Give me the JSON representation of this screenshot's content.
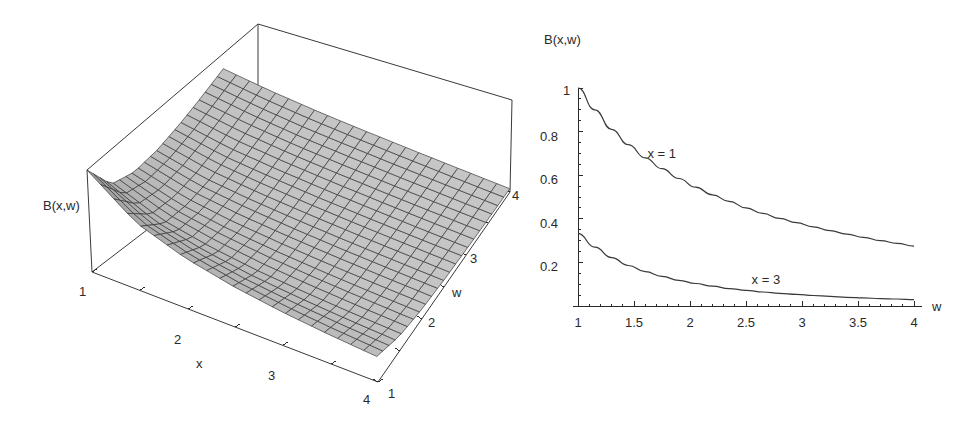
{
  "figure": {
    "background_color": "#ffffff",
    "ink_color": "#2b2b2b",
    "surface_fill_color": "#b9b9b9",
    "panels": [
      {
        "id": "surface-plot",
        "kind": "3d-surface"
      },
      {
        "id": "line-plot",
        "kind": "2d-line"
      }
    ]
  },
  "plot3d": {
    "vertical_axis_label": "B(x,w)",
    "x_axis_label": "x",
    "w_axis_label": "w",
    "x_ticks": [
      "1",
      "2",
      "3",
      "4"
    ],
    "w_ticks": [
      "1",
      "2",
      "3",
      "4"
    ],
    "x_range": [
      1,
      4
    ],
    "w_range": [
      1,
      4
    ],
    "mesh_divisions": 22
  },
  "plot2d": {
    "y_axis_label": "B(x,w)",
    "x_axis_label": "w",
    "x_ticks": [
      "1",
      "1.5",
      "2",
      "2.5",
      "3",
      "3.5",
      "4"
    ],
    "y_ticks": [
      "0.2",
      "0.4",
      "0.6",
      "0.8",
      "1"
    ],
    "curve_labels": [
      "x = 1",
      "x = 3"
    ]
  },
  "chart_data": [
    {
      "type": "surface",
      "title": "",
      "zlabel": "B(x,w)",
      "xlabel": "x",
      "ylabel": "w",
      "xlim": [
        1,
        4
      ],
      "ylim": [
        1,
        4
      ],
      "zlim": [
        0,
        1
      ],
      "xticks": [
        1,
        2,
        3,
        4
      ],
      "yticks": [
        1,
        2,
        3,
        4
      ],
      "grid": false,
      "legend": "none",
      "description": "Monotonically decreasing surface B(x,w); maximum at x=1,w=1 and decaying toward large x and large w.",
      "x": [
        1,
        1.5,
        2,
        2.5,
        3,
        3.5,
        4
      ],
      "y": [
        1,
        1.5,
        2,
        2.5,
        3,
        3.5,
        4
      ],
      "z": [
        [
          1.0,
          0.55,
          0.36,
          0.26,
          0.2,
          0.16,
          0.13
        ],
        [
          0.66,
          0.37,
          0.24,
          0.17,
          0.13,
          0.11,
          0.09
        ],
        [
          0.5,
          0.28,
          0.18,
          0.13,
          0.1,
          0.08,
          0.065
        ],
        [
          0.4,
          0.22,
          0.145,
          0.105,
          0.08,
          0.065,
          0.052
        ],
        [
          0.333,
          0.185,
          0.12,
          0.087,
          0.067,
          0.054,
          0.043
        ],
        [
          0.286,
          0.158,
          0.103,
          0.075,
          0.057,
          0.046,
          0.037
        ],
        [
          0.25,
          0.139,
          0.09,
          0.065,
          0.05,
          0.04,
          0.032
        ]
      ]
    },
    {
      "type": "line",
      "title": "",
      "xlabel": "w",
      "ylabel": "B(x,w)",
      "xlim": [
        1,
        4
      ],
      "ylim": [
        0,
        1
      ],
      "xticks": [
        1,
        1.5,
        2,
        2.5,
        3,
        3.5,
        4
      ],
      "yticks": [
        0.2,
        0.4,
        0.6,
        0.8,
        1
      ],
      "grid": false,
      "legend": "inline-annotations",
      "x": [
        1,
        1.15,
        1.3,
        1.45,
        1.6,
        1.75,
        1.9,
        2.05,
        2.2,
        2.35,
        2.5,
        2.65,
        2.8,
        2.95,
        3.1,
        3.25,
        3.4,
        3.55,
        3.7,
        3.85,
        4
      ],
      "series": [
        {
          "name": "x = 1",
          "label_position": [
            1.62,
            0.68
          ],
          "values": [
            1.0,
            0.9,
            0.81,
            0.74,
            0.68,
            0.63,
            0.585,
            0.545,
            0.51,
            0.48,
            0.45,
            0.425,
            0.402,
            0.382,
            0.363,
            0.346,
            0.33,
            0.315,
            0.3,
            0.287,
            0.275
          ]
        },
        {
          "name": "x = 3",
          "label_position": [
            2.55,
            0.1
          ],
          "values": [
            0.333,
            0.27,
            0.222,
            0.186,
            0.158,
            0.136,
            0.118,
            0.103,
            0.091,
            0.08,
            0.072,
            0.064,
            0.058,
            0.053,
            0.048,
            0.044,
            0.04,
            0.037,
            0.034,
            0.032,
            0.029
          ]
        }
      ]
    }
  ]
}
